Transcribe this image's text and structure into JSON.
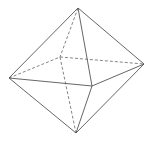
{
  "diagram": {
    "type": "octahedron-wireframe",
    "background": "#ffffff",
    "edge_color": "#555555",
    "hidden_edge_color": "#777777",
    "vertices": {
      "top": [
        78,
        8
      ],
      "left": [
        9,
        78
      ],
      "right": [
        144,
        64
      ],
      "front": [
        92,
        86
      ],
      "back": [
        60,
        57
      ],
      "bottom": [
        76,
        133
      ]
    },
    "visible_edges": [
      [
        "top",
        "left"
      ],
      [
        "top",
        "right"
      ],
      [
        "top",
        "front"
      ],
      [
        "left",
        "front"
      ],
      [
        "front",
        "right"
      ],
      [
        "left",
        "bottom"
      ],
      [
        "right",
        "bottom"
      ],
      [
        "front",
        "bottom"
      ]
    ],
    "hidden_edges": [
      [
        "top",
        "back"
      ],
      [
        "left",
        "back"
      ],
      [
        "back",
        "right"
      ],
      [
        "back",
        "bottom"
      ]
    ]
  }
}
